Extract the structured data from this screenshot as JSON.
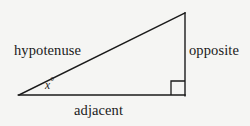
{
  "figure": {
    "background_color": "#f5f5f3",
    "stroke_color": "#1a1a1a",
    "text_color": "#1a1a1a"
  },
  "labels": {
    "hypotenuse": "hypotenuse",
    "opposite": "opposite",
    "adjacent": "adjacent",
    "angle_variable": "x",
    "angle_degree_symbol": "°"
  },
  "geometry": {
    "vertex_left": {
      "x": 19,
      "y": 95
    },
    "vertex_top_right": {
      "x": 185,
      "y": 13
    },
    "vertex_bottom_right": {
      "x": 185,
      "y": 95
    },
    "right_angle_marker": {
      "x": 171,
      "y": 81,
      "size": 14
    },
    "stroke_width": 1.4
  }
}
